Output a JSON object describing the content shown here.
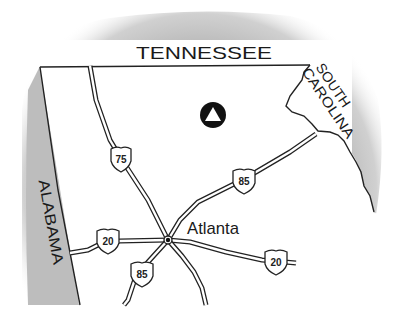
{
  "map": {
    "region": "Georgia (north)",
    "colors": {
      "neighbor_fill": "#bdbdbd",
      "state_fill": "#ffffff",
      "border_stroke": "#222222",
      "background": "#ffffff"
    },
    "states": {
      "north": "TENNESSEE",
      "east_line1": "SOUTH",
      "east_line2": "CAROLINA",
      "west": "ALABAMA"
    },
    "city": {
      "name": "Atlanta"
    },
    "highways": [
      {
        "id": "i75",
        "number": "75"
      },
      {
        "id": "i85-ne",
        "number": "85"
      },
      {
        "id": "i85-sw",
        "number": "85"
      },
      {
        "id": "i20-w",
        "number": "20"
      },
      {
        "id": "i20-e",
        "number": "20"
      }
    ],
    "marker": {
      "icon": "triangle-in-circle-icon"
    }
  }
}
